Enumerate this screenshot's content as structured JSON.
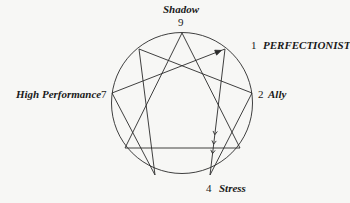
{
  "diagram": {
    "type": "enneagram",
    "circle": {
      "cx": 182,
      "cy": 103,
      "r": 70.5
    },
    "points": [
      {
        "id": "9",
        "x": 182,
        "y": 33
      },
      {
        "id": "1",
        "x": 225,
        "y": 49
      },
      {
        "id": "2",
        "x": 252,
        "y": 93
      },
      {
        "id": "3",
        "x": 240,
        "y": 148
      },
      {
        "id": "4",
        "x": 210,
        "y": 175
      },
      {
        "id": "5",
        "x": 155,
        "y": 175
      },
      {
        "id": "6",
        "x": 125,
        "y": 148
      },
      {
        "id": "7",
        "x": 112,
        "y": 93
      },
      {
        "id": "8",
        "x": 139,
        "y": 49
      }
    ],
    "triangle": [
      "9",
      "3",
      "6"
    ],
    "hexad": [
      "1",
      "4",
      "2",
      "8",
      "5",
      "7"
    ],
    "arrow": {
      "from": "7",
      "to": "1"
    },
    "stress_arrows": {
      "from": "1",
      "to": "4",
      "chevrons": 3
    }
  },
  "labels": {
    "top": {
      "name": "Shadow",
      "number": "9"
    },
    "right_top": {
      "number": "1",
      "name": "PERFECTIONIST"
    },
    "right": {
      "number": "2",
      "name": "Ally"
    },
    "left": {
      "name": "High Performance",
      "number": "7"
    },
    "bottom": {
      "number": "4",
      "name": "Stress"
    }
  }
}
